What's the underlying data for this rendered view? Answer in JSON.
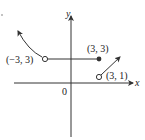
{
  "figure": {
    "axes": {
      "x_label": "x",
      "y_label": "y",
      "origin_label": "0"
    },
    "points": [
      {
        "label": "(−3, 3)",
        "x": -3,
        "y": 3,
        "marker": "open"
      },
      {
        "label": "(3, 3)",
        "x": 3,
        "y": 3,
        "marker": "filled"
      },
      {
        "label": "(3, 1)",
        "x": 3,
        "y": 1,
        "marker": "open"
      }
    ],
    "segments": [
      {
        "type": "curve",
        "from": [
          -3,
          3
        ],
        "direction": "up-left",
        "arrow": true
      },
      {
        "type": "line",
        "from": [
          -3,
          3
        ],
        "to": [
          3,
          3
        ],
        "start": "open",
        "end": "closed"
      },
      {
        "type": "line",
        "from": [
          3,
          1
        ],
        "direction": "up-right",
        "slope": 1,
        "start": "open",
        "arrow": true
      }
    ],
    "colors": {
      "stroke": "#333333",
      "text": "#222222",
      "background": "#ffffff"
    }
  }
}
